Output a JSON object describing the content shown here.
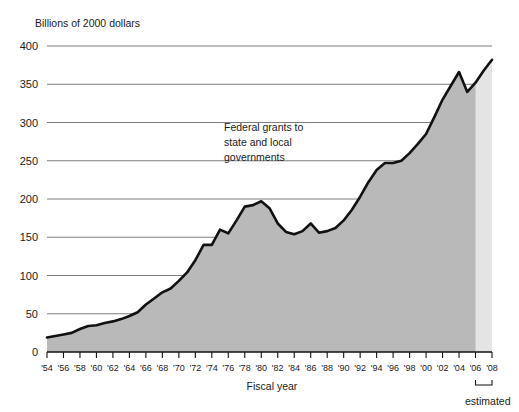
{
  "chart_data": {
    "type": "area",
    "title": "",
    "unit_label": "Billions of 2000 dollars",
    "annotation": {
      "line1": "Federal grants to",
      "line2": "state and local",
      "line3": "governments"
    },
    "xlabel": "Fiscal year",
    "ylabel": "",
    "ylim": [
      0,
      400
    ],
    "yticks": [
      0,
      50,
      100,
      150,
      200,
      250,
      300,
      350,
      400
    ],
    "ytick_labels": [
      "0",
      "50",
      "100",
      "150",
      "200",
      "250",
      "300",
      "350",
      "400"
    ],
    "xlim": [
      1954,
      2008
    ],
    "xticks": [
      1954,
      1956,
      1958,
      1960,
      1962,
      1964,
      1966,
      1968,
      1970,
      1972,
      1974,
      1976,
      1978,
      1980,
      1982,
      1984,
      1986,
      1988,
      1990,
      1992,
      1994,
      1996,
      1998,
      2000,
      2002,
      2004,
      2006,
      2008
    ],
    "xtick_labels": [
      "'54",
      "'56",
      "'58",
      "'60",
      "'62",
      "'64",
      "'66",
      "'68",
      "'70",
      "'72",
      "'74",
      "'76",
      "'78",
      "'80",
      "'82",
      "'84",
      "'86",
      "'88",
      "'90",
      "'92",
      "'94",
      "'96",
      "'98",
      "'00",
      "'02",
      "'04",
      "'06",
      "'08"
    ],
    "grid": true,
    "legend_position": "none",
    "estimated_label": "estimated",
    "estimated_start_year": 2006,
    "estimated_end_year": 2008,
    "colors": {
      "area_fill": "#b9b9b9",
      "estimated_fill": "#e4e4e4",
      "line": "#111111",
      "gridline": "#6e6e6e",
      "axis": "#111111",
      "text": "#1a1a1a"
    },
    "x": [
      1954,
      1955,
      1956,
      1957,
      1958,
      1959,
      1960,
      1961,
      1962,
      1963,
      1964,
      1965,
      1966,
      1967,
      1968,
      1969,
      1970,
      1971,
      1972,
      1973,
      1974,
      1975,
      1976,
      1977,
      1978,
      1979,
      1980,
      1981,
      1982,
      1983,
      1984,
      1985,
      1986,
      1987,
      1988,
      1989,
      1990,
      1991,
      1992,
      1993,
      1994,
      1995,
      1996,
      1997,
      1998,
      1999,
      2000,
      2001,
      2002,
      2003,
      2004,
      2005,
      2006,
      2007,
      2008
    ],
    "values": [
      19,
      21,
      23,
      25,
      30,
      34,
      35,
      38,
      40,
      43,
      47,
      52,
      62,
      70,
      78,
      83,
      93,
      104,
      120,
      140,
      140,
      160,
      155,
      172,
      190,
      192,
      197,
      188,
      168,
      157,
      154,
      158,
      168,
      156,
      158,
      162,
      172,
      186,
      203,
      222,
      238,
      247,
      247,
      250,
      260,
      272,
      285,
      307,
      330,
      348,
      366,
      340,
      352,
      368,
      382
    ]
  }
}
